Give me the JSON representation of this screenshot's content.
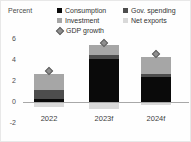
{
  "chart_data": {
    "type": "bar",
    "subtype": "stacked-with-markers",
    "title": "",
    "ylabel": "Percent",
    "xlabel": "",
    "categories": [
      "2022",
      "2023f",
      "2024f"
    ],
    "series": [
      {
        "name": "Consumption",
        "color": "#0a0a0a",
        "values": [
          0.3,
          4.1,
          2.4
        ]
      },
      {
        "name": "Gov. spending",
        "color": "#4d4d4d",
        "values": [
          0.8,
          0.4,
          0.3
        ]
      },
      {
        "name": "Investment",
        "color": "#a6a6a6",
        "values": [
          1.6,
          0.9,
          1.6
        ]
      },
      {
        "name": "Net exports",
        "color": "#d9d9d9",
        "values": [
          -0.4,
          -0.6,
          -0.2
        ]
      }
    ],
    "markers": {
      "name": "GDP growth",
      "color": "#8f8f8f",
      "border_color": "#636363",
      "values": [
        3.0,
        5.6,
        4.6
      ]
    },
    "yticks": [
      -2,
      0,
      2,
      4,
      6
    ],
    "ylim": [
      -2,
      6.5
    ],
    "grid": false,
    "legend_position": "top",
    "axis_line_color": "#a8a8a8"
  }
}
